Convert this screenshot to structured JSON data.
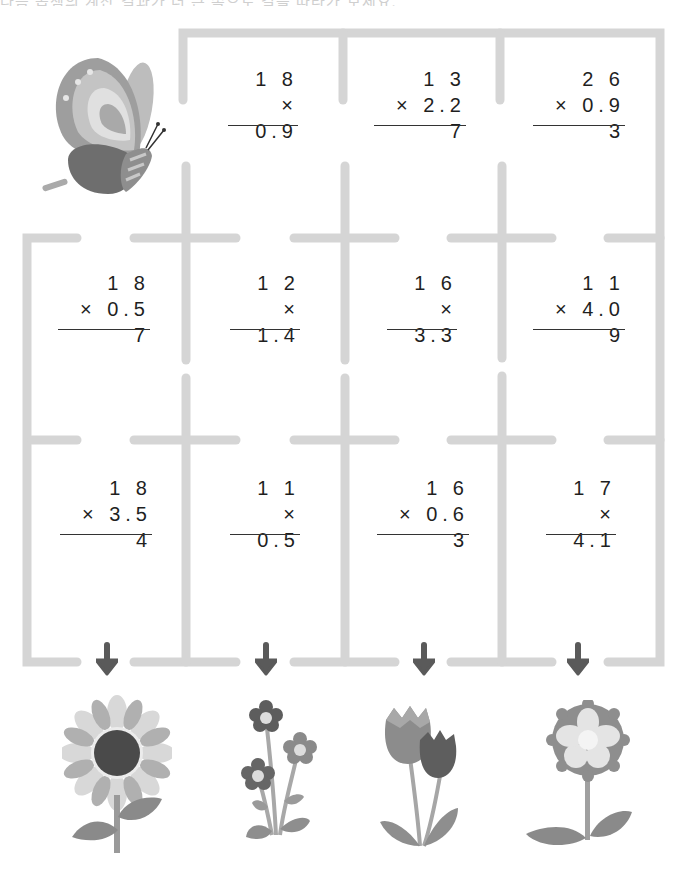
{
  "header": {
    "text": "다음 곱셈의 계산 결과가 더 큰 쪽으로 길을 따라가 보세요."
  },
  "colors": {
    "maze_line": "#d5d5d5",
    "arrow": "#5a5a5a",
    "text": "#1f1f1f",
    "background": "#ffffff"
  },
  "problems": [
    {
      "id": "r1c2",
      "top": "1 8",
      "bottom": "× 0.9"
    },
    {
      "id": "r1c3",
      "top": "1 3",
      "bottom": "× 2.2 7"
    },
    {
      "id": "r1c4",
      "top": "2 6",
      "bottom": "× 0.9 3"
    },
    {
      "id": "r2c1",
      "top": "1 8",
      "bottom": "× 0.5 7"
    },
    {
      "id": "r2c2",
      "top": "1 2",
      "bottom": "× 1.4"
    },
    {
      "id": "r2c3",
      "top": "1 6",
      "bottom": "× 3.3"
    },
    {
      "id": "r2c4",
      "top": "1 1",
      "bottom": "× 4.0 9"
    },
    {
      "id": "r3c1",
      "top": "1 8",
      "bottom": "× 3.5 4"
    },
    {
      "id": "r3c2",
      "top": "1 1",
      "bottom": "× 0.5"
    },
    {
      "id": "r3c3",
      "top": "1 6",
      "bottom": "× 0.6 3"
    },
    {
      "id": "r3c4",
      "top": "1 7",
      "bottom": "× 4.1"
    }
  ],
  "illustrations": {
    "start": "butterfly",
    "exits": [
      "sunflower",
      "small-flower-bunch",
      "tulips",
      "round-bloom-flower"
    ]
  }
}
